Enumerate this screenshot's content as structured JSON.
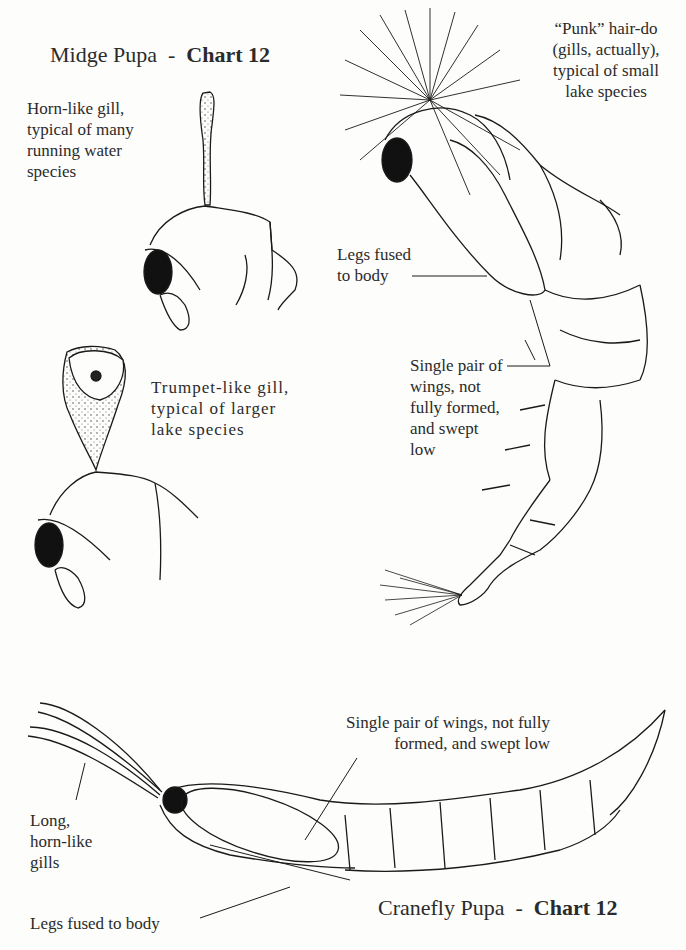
{
  "midge": {
    "title_main": "Midge Pupa",
    "title_sep": "-",
    "title_chart": "Chart 12",
    "labels": {
      "horn_gill": [
        "Horn-like gill,",
        "typical of many",
        "running water",
        "species"
      ],
      "trumpet_gill": [
        "Trumpet-like gill,",
        "typical of larger",
        "lake species"
      ],
      "punk": [
        "“Punk” hair-do",
        "(gills, actually),",
        "typical of small",
        "lake species"
      ],
      "legs": [
        "Legs fused",
        "to body"
      ],
      "wings": [
        "Single pair of",
        "wings, not",
        "fully formed,",
        "and swept",
        "low"
      ]
    }
  },
  "cranefly": {
    "title_main": "Cranefly Pupa",
    "title_sep": "-",
    "title_chart": "Chart 12",
    "labels": {
      "wings": [
        "Single pair of wings, not fully",
        "formed, and swept low"
      ],
      "gills": [
        "Long,",
        "horn-like",
        "gills"
      ],
      "legs": [
        "Legs fused to body"
      ]
    }
  },
  "colors": {
    "ink": "#1a1a1a",
    "paper": "#fdfdfb"
  }
}
